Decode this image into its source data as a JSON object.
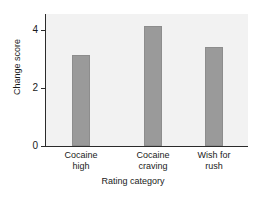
{
  "chart_data": {
    "type": "bar",
    "title": "",
    "categories": [
      "Cocaine high",
      "Cocaine craving",
      "Wish for rush"
    ],
    "category_lines": [
      [
        "Cocaine",
        "high"
      ],
      [
        "Cocaine",
        "craving"
      ],
      [
        "Wish for",
        "rush"
      ]
    ],
    "values": [
      3.15,
      4.15,
      3.4
    ],
    "xlabel": "Rating category",
    "ylabel": "Change score",
    "ylim": [
      0,
      4.55
    ],
    "yticks": [
      0,
      2,
      4
    ],
    "ytick_labels": [
      "0",
      "2",
      "4"
    ],
    "grid": false,
    "legend": null,
    "bar_color": "#9a9a9a",
    "plot_background": "#f2f2f2",
    "axis_color": "#2b2b2b"
  }
}
